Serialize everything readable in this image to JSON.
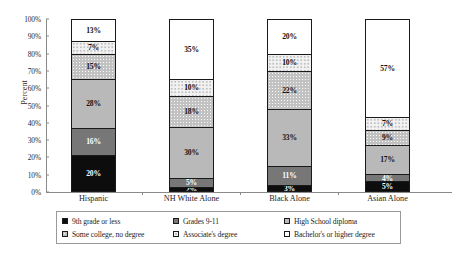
{
  "chart_data": {
    "type": "bar",
    "stacked": true,
    "title": "",
    "xlabel": "",
    "ylabel": "Percent",
    "ylim": [
      0,
      100
    ],
    "ytick_labels": [
      "0%",
      "10%",
      "20%",
      "30%",
      "40%",
      "50%",
      "60%",
      "70%",
      "80%",
      "90%",
      "100%"
    ],
    "ytick_values": [
      0,
      10,
      20,
      30,
      40,
      50,
      60,
      70,
      80,
      90,
      100
    ],
    "grid": false,
    "legend_position": "bottom",
    "categories": [
      "Hispanic",
      "NH White Alone",
      "Black Alone",
      "Asian Alone"
    ],
    "series": [
      {
        "name": "9th grade or less",
        "fill": "f-black",
        "dark": true,
        "values": [
          20,
          2,
          3,
          5
        ]
      },
      {
        "name": "Grades 9-11",
        "fill": "f-midgray",
        "dark": true,
        "values": [
          16,
          5,
          11,
          4
        ]
      },
      {
        "name": "High School diploma",
        "fill": "f-litegray",
        "dark": false,
        "values": [
          28,
          30,
          33,
          17
        ]
      },
      {
        "name": "Some college, no degree",
        "fill": "f-dots",
        "dark": false,
        "values": [
          15,
          18,
          22,
          9
        ]
      },
      {
        "name": "Associate's degree",
        "fill": "f-sparse",
        "dark": false,
        "values": [
          7,
          10,
          10,
          7
        ]
      },
      {
        "name": "Bachelor's or higher degree",
        "fill": "f-white",
        "dark": false,
        "values": [
          13,
          35,
          20,
          57
        ]
      }
    ],
    "value_labels": {
      "Hispanic": [
        "20%",
        "16%",
        "28%",
        "15%",
        "7%",
        "13%"
      ],
      "NH White Alone": [
        "2%",
        "5%",
        "30%",
        "18%",
        "10%",
        "35%"
      ],
      "Black Alone": [
        "3%",
        "11%",
        "33%",
        "22%",
        "10%",
        "20%"
      ],
      "Asian Alone": [
        "5%",
        "4%",
        "17%",
        "9%",
        "7%",
        "57%"
      ]
    }
  },
  "legend": {
    "items": [
      {
        "label": "9th grade or less",
        "fill": "f-black"
      },
      {
        "label": "Grades 9-11",
        "fill": "f-midgray"
      },
      {
        "label": "High School diploma",
        "fill": "f-litegray"
      },
      {
        "label": "Some college, no degree",
        "fill": "f-dots"
      },
      {
        "label": "Associate's degree",
        "fill": "f-sparse"
      },
      {
        "label": "Bachelor's or higher degree",
        "fill": "f-white"
      }
    ]
  }
}
